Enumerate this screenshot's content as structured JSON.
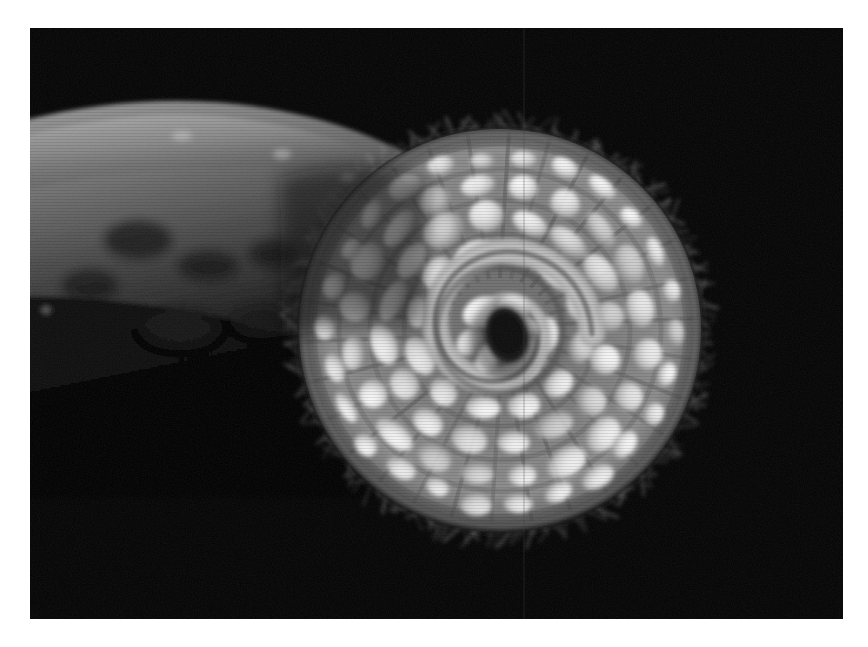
{
  "page": {
    "background_color": "#ffffff",
    "width": 868,
    "height": 647,
    "caption": ""
  },
  "photo": {
    "name": "grayscale-macro-photograph",
    "alt_text": "Black and white macro photograph of a spiral coiled disc with radiating rounded lobes, a fringe of fine spines around its rim, and a dark stalk extending to the upper left",
    "frame": {
      "x": 30,
      "y": 28,
      "width": 813,
      "height": 591
    },
    "background_color": "#030303",
    "subject": "coiled-spiral-disc",
    "palette": {
      "background": "#030303",
      "lobe_highlight": "#f2f2f2",
      "lobe_mid": "#cfcfcf",
      "furrow": "#5a5a5a",
      "rim_halo": "#8a8a8a",
      "spine": "#7e7e7e",
      "stalk_light": "#8d8d8d",
      "stalk_mid": "#4a4a4a",
      "stalk_dark": "#121212",
      "center_eye": "#000000"
    },
    "disc": {
      "center_x": 470,
      "center_y": 302,
      "radius": 203,
      "eye": {
        "cx": 477,
        "cy": 305,
        "rx": 20,
        "ry": 27
      },
      "rings": [
        {
          "index": 1,
          "radius": 48,
          "lobe_count": 7,
          "lobe_rx": 15,
          "lobe_ry": 11
        },
        {
          "index": 2,
          "radius": 80,
          "lobe_count": 12,
          "lobe_rx": 18,
          "lobe_ry": 13
        },
        {
          "index": 3,
          "radius": 113,
          "lobe_count": 16,
          "lobe_rx": 19,
          "lobe_ry": 14
        },
        {
          "index": 4,
          "radius": 145,
          "lobe_count": 20,
          "lobe_rx": 18,
          "lobe_ry": 13
        },
        {
          "index": 5,
          "radius": 173,
          "lobe_count": 26,
          "lobe_rx": 14,
          "lobe_ry": 10
        }
      ],
      "spiral_arm": {
        "turns": 1.35,
        "start_radius": 18,
        "end_radius": 92
      },
      "spine_fringe": {
        "count": 210,
        "length_min": 7,
        "length_max": 20
      }
    },
    "stalk": {
      "description": "tapering dark stem entering from upper-left and passing behind the disc",
      "top_edge": [
        [
          30,
          150
        ],
        [
          120,
          118
        ],
        [
          215,
          105
        ],
        [
          300,
          118
        ],
        [
          360,
          142
        ]
      ],
      "bottom_edge": [
        [
          30,
          400
        ],
        [
          110,
          378
        ],
        [
          190,
          352
        ],
        [
          250,
          332
        ]
      ]
    },
    "artifacts": {
      "scan_line": {
        "x": 524,
        "color": "#3a3a3a",
        "opacity": 0.35
      }
    }
  }
}
